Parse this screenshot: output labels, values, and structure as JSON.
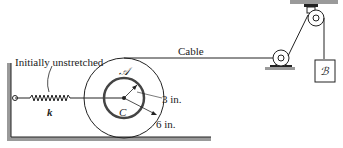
{
  "diagram": {
    "labels": {
      "spring_note": "Initially unstretched",
      "spring": "k",
      "disk": "𝒜",
      "center": "C",
      "inner_radius": "3 in.",
      "outer_radius": "6 in.",
      "cable": "Cable",
      "block": "ℬ"
    },
    "colors": {
      "line": "#222222",
      "ground": "#9a9a9a"
    }
  }
}
